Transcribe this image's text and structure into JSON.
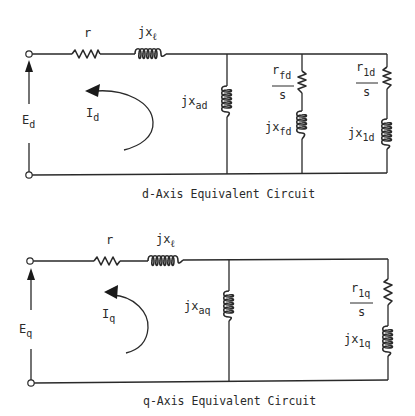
{
  "d_axis": {
    "caption": "d-Axis Equivalent Circuit",
    "voltage": {
      "main": "E",
      "sub": "d"
    },
    "current": {
      "main": "I",
      "sub": "d"
    },
    "series_resistor": {
      "main": "r"
    },
    "series_reactance": {
      "main": "jx",
      "sub": "ℓ"
    },
    "magnetizing_reactance": {
      "main": "jx",
      "sub": "ad"
    },
    "field_resistance": {
      "num_main": "r",
      "num_sub": "fd",
      "den": "s"
    },
    "field_reactance": {
      "main": "jx",
      "sub": "fd"
    },
    "damper_resistance": {
      "num_main": "r",
      "num_sub": "1d",
      "den": "s"
    },
    "damper_reactance": {
      "main": "jx",
      "sub": "1d"
    }
  },
  "q_axis": {
    "caption": "q-Axis Equivalent Circuit",
    "voltage": {
      "main": "E",
      "sub": "q"
    },
    "current": {
      "main": "I",
      "sub": "q"
    },
    "series_resistor": {
      "main": "r"
    },
    "series_reactance": {
      "main": "jx",
      "sub": "ℓ"
    },
    "magnetizing_reactance": {
      "main": "jx",
      "sub": "aq"
    },
    "damper_resistance": {
      "num_main": "r",
      "num_sub": "1q",
      "den": "s"
    },
    "damper_reactance": {
      "main": "jx",
      "sub": "1q"
    }
  },
  "colors": {
    "ink": "#2a2a2a",
    "background": "#ffffff"
  }
}
